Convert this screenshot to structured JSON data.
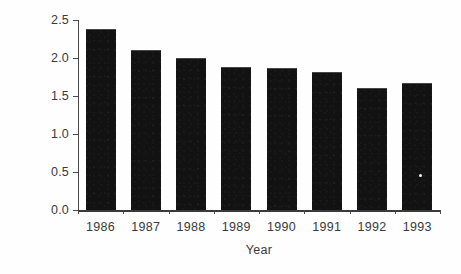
{
  "chart_data": {
    "type": "bar",
    "title": "",
    "xlabel": "Year",
    "ylabel": "Rate per 100,000",
    "categories": [
      "1986",
      "1987",
      "1988",
      "1989",
      "1990",
      "1991",
      "1992",
      "1993"
    ],
    "values": [
      2.38,
      2.1,
      2.0,
      1.88,
      1.87,
      1.81,
      1.6,
      1.67
    ],
    "ylim": [
      0.0,
      2.5
    ],
    "yticks": [
      0.0,
      0.5,
      1.0,
      1.5,
      2.0,
      2.5
    ],
    "ytick_labels": [
      "0.0",
      "0.5",
      "1.0",
      "1.5",
      "2.0",
      "2.5"
    ],
    "grid": false,
    "legend": false,
    "legend_position": "none",
    "bar_color": "#121212",
    "axis_color": "#3a3a3a",
    "background_color": "#fefefe"
  }
}
